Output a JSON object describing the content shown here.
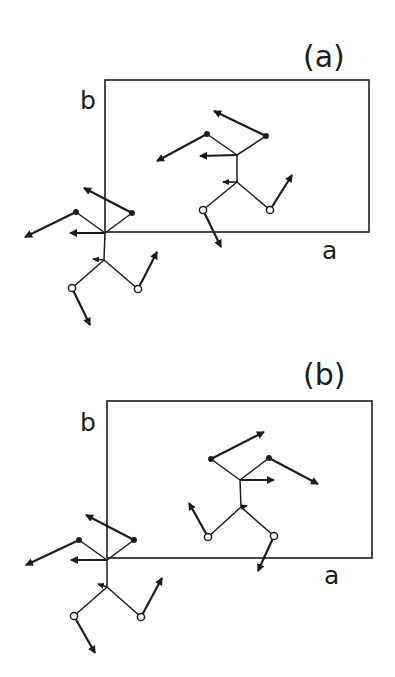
{
  "figure": {
    "ink_color": "#1c1c1c",
    "background": "#ffffff",
    "panels": [
      {
        "id": "a",
        "label": "(a)",
        "label_pos": [
          303,
          42
        ],
        "axis_labels": {
          "b": {
            "text": "b",
            "pos": [
              80,
              88
            ]
          },
          "a": {
            "text": "a",
            "pos": [
              322,
              238
            ]
          }
        },
        "cell": {
          "x": 105,
          "y": 80,
          "width": 264,
          "height": 152
        },
        "molecules": [
          {
            "name": "molecule-in-cell",
            "atoms": {
              "c_upper": [
                237,
                155
              ],
              "c_lower": [
                237,
                182
              ],
              "top_left": [
                207,
                134
              ],
              "top_right": [
                266,
                136
              ],
              "o_left": [
                203,
                210
              ],
              "o_right": [
                270,
                210
              ]
            },
            "bonds": [
              [
                "c_upper",
                "c_lower"
              ],
              [
                "c_upper",
                "top_left"
              ],
              [
                "c_upper",
                "top_right"
              ],
              [
                "c_lower",
                "o_left"
              ],
              [
                "c_lower",
                "o_right"
              ]
            ],
            "open_atoms": [
              "o_left",
              "o_right"
            ],
            "vectors": [
              {
                "from": "top_right",
                "to": [
                  214,
                  111
                ]
              },
              {
                "from": "top_left",
                "to": [
                  157,
                  161
                ]
              },
              {
                "from": "c_upper",
                "to": [
                  200,
                  156
                ]
              },
              {
                "from": "c_lower",
                "to": [
                  223,
                  182
                ],
                "small": true
              },
              {
                "from": "o_left",
                "to": [
                  221,
                  247
                ]
              },
              {
                "from": "o_right",
                "to": [
                  292,
                  175
                ]
              }
            ]
          },
          {
            "name": "molecule-at-origin",
            "atoms": {
              "c_upper": [
                105,
                233
              ],
              "c_lower": [
                104,
                260
              ],
              "top_left": [
                76,
                212
              ],
              "top_right": [
                132,
                213
              ],
              "o_left": [
                72,
                288
              ],
              "o_right": [
                138,
                289
              ]
            },
            "bonds": [
              [
                "c_upper",
                "c_lower"
              ],
              [
                "c_upper",
                "top_left"
              ],
              [
                "c_upper",
                "top_right"
              ],
              [
                "c_lower",
                "o_left"
              ],
              [
                "c_lower",
                "o_right"
              ]
            ],
            "open_atoms": [
              "o_left",
              "o_right"
            ],
            "vectors": [
              {
                "from": "top_right",
                "to": [
                  84,
                  188
                ]
              },
              {
                "from": "top_left",
                "to": [
                  25,
                  237
                ]
              },
              {
                "from": "c_upper",
                "to": [
                  70,
                  233
                ]
              },
              {
                "from": "c_lower",
                "to": [
                  93,
                  259
                ],
                "small": true
              },
              {
                "from": "o_left",
                "to": [
                  90,
                  325
                ]
              },
              {
                "from": "o_right",
                "to": [
                  157,
                  252
                ]
              }
            ]
          }
        ]
      },
      {
        "id": "b",
        "label": "(b)",
        "label_pos": [
          303,
          360
        ],
        "axis_labels": {
          "b": {
            "text": "b",
            "pos": [
              80,
              410
            ]
          },
          "a": {
            "text": "a",
            "pos": [
              324,
              563
            ]
          }
        },
        "cell": {
          "x": 107,
          "y": 401,
          "width": 265,
          "height": 157
        },
        "molecules": [
          {
            "name": "molecule-in-cell",
            "atoms": {
              "c_upper": [
                240,
                480
              ],
              "c_lower": [
                241,
                507
              ],
              "top_left": [
                211,
                459
              ],
              "top_right": [
                269,
                458
              ],
              "o_left": [
                208,
                537
              ],
              "o_right": [
                274,
                536
              ]
            },
            "bonds": [
              [
                "c_upper",
                "c_lower"
              ],
              [
                "c_upper",
                "top_left"
              ],
              [
                "c_upper",
                "top_right"
              ],
              [
                "c_lower",
                "o_left"
              ],
              [
                "c_lower",
                "o_right"
              ]
            ],
            "open_atoms": [
              "o_left",
              "o_right"
            ],
            "vectors": [
              {
                "from": "top_left",
                "to": [
                  264,
                  432
                ]
              },
              {
                "from": "top_right",
                "to": [
                  318,
                  484
                ]
              },
              {
                "from": "c_upper",
                "to": [
                  274,
                  480
                ]
              },
              {
                "from": "c_lower",
                "to": [
                  247,
                  506
                ],
                "small": true
              },
              {
                "from": "o_left",
                "to": [
                  189,
                  503
                ]
              },
              {
                "from": "o_right",
                "to": [
                  258,
                  571
                ]
              }
            ]
          },
          {
            "name": "molecule-at-origin",
            "atoms": {
              "c_upper": [
                107,
                560
              ],
              "c_lower": [
                107,
                587
              ],
              "top_left": [
                79,
                540
              ],
              "top_right": [
                134,
                540
              ],
              "o_left": [
                74,
                616
              ],
              "o_right": [
                141,
                617
              ]
            },
            "bonds": [
              [
                "c_upper",
                "c_lower"
              ],
              [
                "c_upper",
                "top_left"
              ],
              [
                "c_upper",
                "top_right"
              ],
              [
                "c_lower",
                "o_left"
              ],
              [
                "c_lower",
                "o_right"
              ]
            ],
            "open_atoms": [
              "o_left",
              "o_right"
            ],
            "vectors": [
              {
                "from": "top_right",
                "to": [
                  86,
                  515
                ]
              },
              {
                "from": "top_left",
                "to": [
                  26,
                  565
                ]
              },
              {
                "from": "c_upper",
                "to": [
                  71,
                  560
                ]
              },
              {
                "from": "c_lower",
                "to": [
                  98,
                  584
                ],
                "small": true
              },
              {
                "from": "o_left",
                "to": [
                  95,
                  653
                ]
              },
              {
                "from": "o_right",
                "to": [
                  162,
                  578
                ]
              }
            ]
          }
        ]
      }
    ]
  }
}
